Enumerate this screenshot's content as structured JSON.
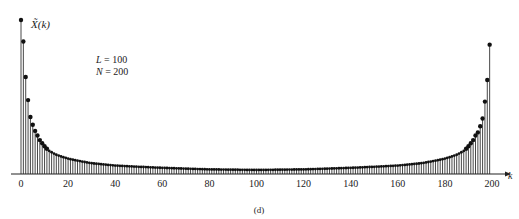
{
  "chart_data": {
    "type": "stem",
    "title": "",
    "subtitle": "(d)",
    "ylabel": "X̃(k)",
    "xlabel": "k",
    "annotations": [
      "L = 100",
      "N = 200"
    ],
    "params": {
      "L": "L = 100",
      "N": "N = 200"
    },
    "x_ticks": [
      0,
      20,
      40,
      60,
      80,
      100,
      120,
      140,
      160,
      180,
      200
    ],
    "xlim": [
      0,
      200
    ],
    "ylim": [
      0,
      100
    ],
    "grid": false,
    "legend": null,
    "anchor_values": {
      "0": 100,
      "1": 86,
      "2": 63,
      "3": 48,
      "4": 37,
      "5": 32,
      "6": 28,
      "7": 25,
      "8": 22,
      "9": 20,
      "10": 18,
      "12": 15,
      "15": 12.5,
      "20": 10,
      "30": 7,
      "40": 5.5,
      "60": 4,
      "80": 3,
      "100": 2.6,
      "120": 3,
      "140": 4,
      "160": 5.5,
      "170": 7,
      "180": 10,
      "185": 12.5,
      "188": 15,
      "190": 18,
      "191": 20,
      "192": 22,
      "193": 25,
      "194": 27,
      "195": 31,
      "196": 36,
      "197": 47,
      "198": 61,
      "199": 84
    },
    "n_points": 200
  },
  "caption": "(d)",
  "axis": {
    "ylabel": "X̃(k)",
    "xlabel": "k"
  },
  "legend_text": {
    "L": "= 100",
    "N": "= 200"
  }
}
